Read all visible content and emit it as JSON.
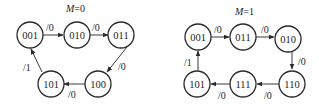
{
  "diagrams": [
    {
      "title_var": "M",
      "title_val": "=0",
      "states": [
        "001",
        "010",
        "011",
        "100",
        "101"
      ],
      "transitions": [
        {
          "from": "001",
          "to": "010",
          "label": "/0"
        },
        {
          "from": "010",
          "to": "011",
          "label": "/0"
        },
        {
          "from": "011",
          "to": "100",
          "label": "/0"
        },
        {
          "from": "100",
          "to": "101",
          "label": "/0"
        },
        {
          "from": "101",
          "to": "001",
          "label": "/1"
        }
      ]
    },
    {
      "title_var": "M",
      "title_val": "=1",
      "states": [
        "001",
        "011",
        "010",
        "110",
        "111",
        "101"
      ],
      "transitions": [
        {
          "from": "001",
          "to": "011",
          "label": "/0"
        },
        {
          "from": "011",
          "to": "010",
          "label": "/0"
        },
        {
          "from": "010",
          "to": "110",
          "label": "/0"
        },
        {
          "from": "110",
          "to": "111",
          "label": "/0"
        },
        {
          "from": "111",
          "to": "101",
          "label": "/0"
        },
        {
          "from": "101",
          "to": "001",
          "label": "/1"
        }
      ]
    }
  ]
}
